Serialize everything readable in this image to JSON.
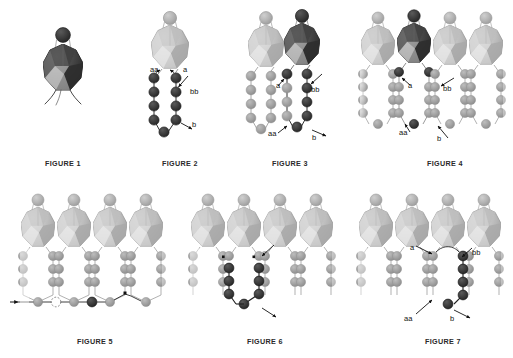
{
  "document": {
    "kind": "patent-figure-sheet",
    "subject": "amphiphilic molecules forming monolayer and bilayer membranes",
    "background_color": "#ffffff"
  },
  "palette": {
    "bead_light": "#b9b9b9",
    "bead_mid": "#9a9a9a",
    "bead_dark": "#3a3a3a",
    "bead_darker": "#2b2b2b",
    "head_light": "#c9c9c9",
    "head_dark": "#4a4a4a",
    "facet_highlight": "#e8e8e8",
    "facet_shadow": "#8e8e8e",
    "line": "#8a8a8a",
    "line_dark": "#2a2a2a",
    "text": "#111111",
    "caption": "#2a2a2a",
    "ghost": "#dddddd"
  },
  "figures": [
    {
      "id": "figure-1",
      "caption": "FIGURE 1",
      "description": "single amphiphilic molecule, dark faceted head with two splayed tails",
      "molecule_count": 1,
      "labels": []
    },
    {
      "id": "figure-2",
      "caption": "FIGURE 2",
      "description": "single molecule with light head and two dark bead chains joined at the base",
      "molecule_count": 1,
      "chain_beads_per_tail": 5,
      "labels": [
        {
          "text": "aa",
          "x": 10,
          "y": 63
        },
        {
          "text": "a",
          "x": 43,
          "y": 63
        },
        {
          "text": "bb",
          "x": 51,
          "y": 87
        },
        {
          "text": "b",
          "x": 52,
          "y": 122
        }
      ]
    },
    {
      "id": "figure-3",
      "caption": "FIGURE 3",
      "description": "two adjacent molecules, right one dark and labelled",
      "molecule_count": 2,
      "chain_beads_per_tail": 5,
      "labels": [
        {
          "text": "a",
          "x": 35,
          "y": 79
        },
        {
          "text": "bb",
          "x": 70,
          "y": 83
        },
        {
          "text": "aa",
          "x": 29,
          "y": 127
        },
        {
          "text": "b",
          "x": 71,
          "y": 132
        }
      ]
    },
    {
      "id": "figure-4",
      "caption": "FIGURE 4",
      "description": "row of four molecules forming a monolayer, second molecule dark and labelled",
      "molecule_count": 4,
      "chain_beads_per_tail": 5,
      "labels": [
        {
          "text": "a",
          "x": 47,
          "y": 77
        },
        {
          "text": "bb",
          "x": 83,
          "y": 80
        },
        {
          "text": "aa",
          "x": 40,
          "y": 125
        },
        {
          "text": "b",
          "x": 76,
          "y": 128
        }
      ]
    },
    {
      "id": "figure-5",
      "caption": "FIGURE 5",
      "description": "row of four light molecules with an open dashed bead site and one filled dark bead at the base, arrows at both ends",
      "molecule_count": 4,
      "chain_beads_per_tail": 5,
      "labels": []
    },
    {
      "id": "figure-6",
      "caption": "FIGURE 6",
      "description": "row of four molecules with two interior tail chains darkened and arrows marking their ends",
      "molecule_count": 4,
      "chain_beads_per_tail": 5,
      "labels": []
    },
    {
      "id": "figure-7",
      "caption": "FIGURE 7",
      "description": "row of four molecules with the right-hand tail chain darkened and labelled",
      "molecule_count": 4,
      "chain_beads_per_tail": 5,
      "labels": [
        {
          "text": "a",
          "x": 55,
          "y": 60
        },
        {
          "text": "bb",
          "x": 102,
          "y": 67
        },
        {
          "text": "aa",
          "x": 48,
          "y": 128
        },
        {
          "text": "b",
          "x": 92,
          "y": 130
        }
      ]
    }
  ],
  "captions": {
    "figure_1": "FIGURE 1",
    "figure_2": "FIGURE 2",
    "figure_3": "FIGURE 3",
    "figure_4": "FIGURE 4",
    "figure_5": "FIGURE 5",
    "figure_6": "FIGURE 6",
    "figure_7": "FIGURE 7"
  }
}
